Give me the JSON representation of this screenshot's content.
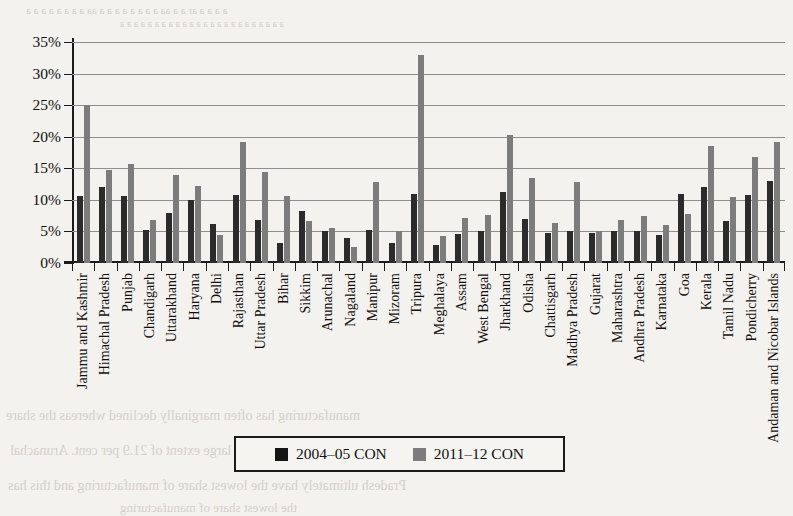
{
  "figure": {
    "background_color": "#f4f2ee",
    "plot_background": "#f6f4f0",
    "gridline_color": "#8e8e8e",
    "axis_color": "#1b1b1b"
  },
  "legend": {
    "position": "bottom-center",
    "items": [
      {
        "label": "2004–05 CON",
        "color": "#151515",
        "swatch": "series-swatch"
      },
      {
        "label": "2011–12 CON",
        "color": "#7c7c7c",
        "swatch": "series-swatch"
      }
    ]
  },
  "bleed_through": [
    {
      "text": "a a a a ar a a aa a a a a a a a a aa a a a a a a a a",
      "x": 26,
      "y": 4,
      "size": 11,
      "flip": true
    },
    {
      "text": "a a a a a a a a a a a a a a a a a a a a a a a a",
      "x": 120,
      "y": 18,
      "size": 10,
      "flip": true
    },
    {
      "text": "manufacturing has often marginally declined whereas the share",
      "x": 6,
      "y": 408,
      "size": 14,
      "flip": true
    },
    {
      "text": "industries gone up to a large extent of 21.9 per cent. Arunachal",
      "x": 10,
      "y": 443,
      "size": 14,
      "flip": true
    },
    {
      "text": "Pradesh  ultimately have the lowest share of manufacturing and this has",
      "x": 8,
      "y": 478,
      "size": 14,
      "flip": true
    },
    {
      "text": "the lowest share of manufacturing",
      "x": 120,
      "y": 500,
      "size": 13,
      "flip": true
    }
  ],
  "chart_data": {
    "type": "bar",
    "title": "",
    "xlabel": "",
    "ylabel": "",
    "ylim": [
      0,
      35
    ],
    "ytick_values": [
      0,
      5,
      10,
      15,
      20,
      25,
      30,
      35
    ],
    "ytick_labels": [
      "0%",
      "5%",
      "10%",
      "15%",
      "20%",
      "25%",
      "30%",
      "35%"
    ],
    "grid": true,
    "grid_axis": "y",
    "categories": [
      "Jammu and Kashmir",
      "Himachal Pradesh",
      "Punjab",
      "Chandigarh",
      "Uttarakhand",
      "Haryana",
      "Delhi",
      "Rajasthan",
      "Uttar Pradesh",
      "Bihar",
      "Sikkim",
      "Arunachal",
      "Nagaland",
      "Manipur",
      "Mizoram",
      "Tripura",
      "Meghalaya",
      "Assam",
      "West Bengal",
      "Jharkhand",
      "Odisha",
      "Chattisgarh",
      "Madhya Pradesh",
      "Gujarat",
      "Maharashtra",
      "Andhra Pradesh",
      "Karnataka",
      "Goa",
      "Kerala",
      "Tamil Nadu",
      "Pondicherry",
      "Andaman and Nicobar Islands"
    ],
    "series": [
      {
        "name": "2004–05 CON",
        "color": "#2b2b2b",
        "values": [
          10.6,
          12.0,
          10.6,
          5.2,
          8.0,
          10.0,
          6.2,
          10.8,
          6.8,
          3.2,
          8.2,
          5.0,
          3.9,
          5.3,
          3.1,
          11.0,
          2.8,
          4.6,
          5.1,
          11.2,
          6.9,
          4.7,
          5.0,
          4.7,
          5.1,
          5.0,
          4.5,
          10.9,
          12.1,
          6.7,
          10.7,
          13.0
        ]
      },
      {
        "name": "2011–12 CON",
        "color": "#7c7c7c",
        "values": [
          25.0,
          14.7,
          15.7,
          6.8,
          13.9,
          12.2,
          4.4,
          19.2,
          14.4,
          10.6,
          6.6,
          5.5,
          2.6,
          12.8,
          5.0,
          32.9,
          4.2,
          7.2,
          7.6,
          20.3,
          13.4,
          6.3,
          12.9,
          5.1,
          6.8,
          7.5,
          6.0,
          7.8,
          18.6,
          10.4,
          16.8,
          19.1
        ]
      }
    ]
  }
}
